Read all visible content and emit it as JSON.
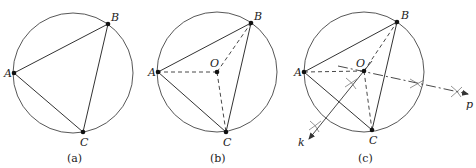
{
  "figure": {
    "panels": [
      {
        "caption": "(a)",
        "points": {
          "A": "A",
          "B": "B",
          "C": "C"
        }
      },
      {
        "caption": "(b)",
        "points": {
          "A": "A",
          "B": "B",
          "C": "C",
          "O": "O"
        }
      },
      {
        "caption": "(c)",
        "points": {
          "A": "A",
          "B": "B",
          "C": "C",
          "O": "O"
        },
        "construction_lines": {
          "k": "k",
          "p": "p"
        }
      }
    ]
  },
  "colors": {
    "stroke": "#333333",
    "background": "#ffffff"
  }
}
